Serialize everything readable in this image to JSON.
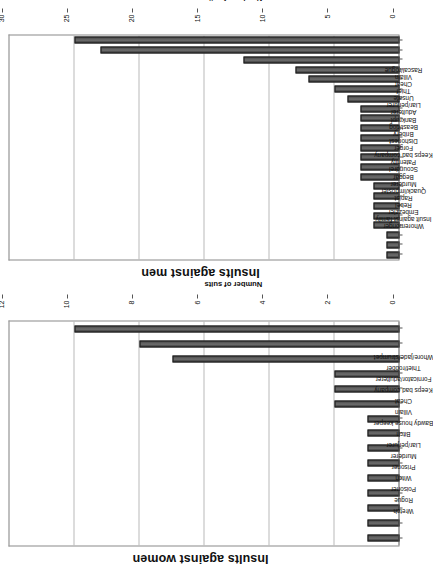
{
  "page": {
    "background": "#ffffff",
    "bar_color": "#4d4d4d",
    "grid_color": "#b9b9b9",
    "axis_color": "#555555"
  },
  "charts": [
    {
      "id": "insults-against-men",
      "title": "Insults against men",
      "value_axis_title": "Number of suits",
      "chart_data": {
        "type": "bar",
        "title": "Insults against men",
        "xlabel": "",
        "ylabel": "Number of suits",
        "ylim": [
          0,
          30
        ],
        "yticks": [
          0,
          5,
          10,
          15,
          20,
          25,
          30
        ],
        "grid": true,
        "orientation": "vertical",
        "categories": [
          "Whoremonger",
          "Insult against family",
          "Embezzler",
          "Rebel",
          "Rapist",
          "Quack/imposter",
          "Murderer",
          "Beggar",
          "Scoundrel",
          "Paternity",
          "Keeps bad company",
          "Forger",
          "Dishonest",
          "Bribery",
          "Beast/dog",
          "Bankrupt",
          "Adulterer",
          "Liar/perjurer",
          "Unsafe",
          "Thief",
          "Cheat",
          "Villain",
          "Rascal/rogue"
        ],
        "values": [
          1,
          1,
          1,
          2,
          2,
          2,
          2,
          2,
          3,
          3,
          3,
          3,
          3,
          3,
          3,
          3,
          4,
          5,
          7,
          8,
          12,
          23,
          25
        ]
      }
    },
    {
      "id": "insults-against-women",
      "title": "Insults against women",
      "value_axis_title": "Number of suits",
      "chart_data": {
        "type": "bar",
        "title": "Insults against women",
        "xlabel": "",
        "ylabel": "Number of suits",
        "ylim": [
          0,
          12
        ],
        "yticks": [
          0,
          2,
          4,
          6,
          8,
          10,
          12
        ],
        "grid": true,
        "orientation": "vertical",
        "categories": [
          "Wretch",
          "Rogue",
          "Poisoner",
          "Witch",
          "Prisoner",
          "Murderer",
          "Liar/perjurer",
          "Bitch",
          "Bawdy house keeper",
          "Villain",
          "Cheat",
          "Keeps bad company",
          "Fornicator/adulterer",
          "Thief/robber",
          "Whore/jade/strumpet"
        ],
        "values": [
          1,
          1,
          1,
          1,
          1,
          1,
          1,
          1,
          1,
          2,
          2,
          2,
          7,
          8,
          10
        ]
      }
    }
  ]
}
